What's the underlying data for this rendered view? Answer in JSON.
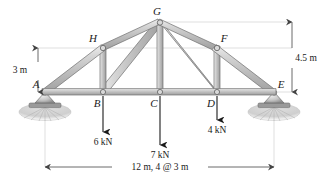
{
  "figure": {
    "type": "truss-free-body-diagram",
    "title": "",
    "background": "#ffffff",
    "member_fill": "#c9c9c9",
    "member_stroke": "#6e6e6e",
    "line_color": "#1a1a1a",
    "dim_color": "#555555"
  },
  "nodes": [
    {
      "id": "A",
      "label": "A",
      "x": 45,
      "y": 92,
      "label_x": 36,
      "label_y": 88
    },
    {
      "id": "B",
      "label": "B",
      "x": 103,
      "y": 92,
      "label_x": 97,
      "label_y": 107
    },
    {
      "id": "C",
      "label": "C",
      "x": 160,
      "y": 92,
      "label_x": 154,
      "label_y": 107
    },
    {
      "id": "D",
      "label": "D",
      "x": 217,
      "y": 92,
      "label_x": 211,
      "label_y": 107
    },
    {
      "id": "E",
      "label": "E",
      "x": 274,
      "y": 92,
      "label_x": 281,
      "label_y": 88
    },
    {
      "id": "F",
      "label": "F",
      "x": 217,
      "y": 48,
      "label_x": 223,
      "label_y": 42
    },
    {
      "id": "G",
      "label": "G",
      "x": 160,
      "y": 22,
      "label_x": 156,
      "label_y": 15
    },
    {
      "id": "H",
      "label": "H",
      "x": 103,
      "y": 48,
      "label_x": 93,
      "label_y": 42
    }
  ],
  "members": [
    {
      "name": "A-B",
      "from": "A",
      "to": "B"
    },
    {
      "name": "B-C",
      "from": "B",
      "to": "C"
    },
    {
      "name": "C-D",
      "from": "C",
      "to": "D"
    },
    {
      "name": "D-E",
      "from": "D",
      "to": "E"
    },
    {
      "name": "A-H",
      "from": "A",
      "to": "H"
    },
    {
      "name": "H-G",
      "from": "H",
      "to": "G"
    },
    {
      "name": "G-F",
      "from": "G",
      "to": "F"
    },
    {
      "name": "F-E",
      "from": "F",
      "to": "E"
    },
    {
      "name": "H-B",
      "from": "H",
      "to": "B"
    },
    {
      "name": "B-G",
      "from": "B",
      "to": "G"
    },
    {
      "name": "C-G",
      "from": "C",
      "to": "G"
    },
    {
      "name": "G-D",
      "from": "G",
      "to": "D"
    },
    {
      "name": "F-D",
      "from": "F",
      "to": "D"
    }
  ],
  "loads": [
    {
      "node": "B",
      "magnitude": "6 kN",
      "label": "6 kN",
      "x": 103,
      "y_start": 96,
      "y_end": 132,
      "label_x": 103,
      "label_y": 145
    },
    {
      "node": "C",
      "magnitude": "7 kN",
      "label": "7 kN",
      "x": 160,
      "y_start": 96,
      "y_end": 145,
      "label_x": 160,
      "label_y": 158
    },
    {
      "node": "D",
      "magnitude": "4 kN",
      "label": "4 kN",
      "x": 217,
      "y_start": 96,
      "y_end": 120,
      "label_x": 217,
      "label_y": 133
    }
  ],
  "dimensions": {
    "height_left": {
      "label": "3 m",
      "label_x": 20,
      "label_y": 72,
      "line_x": 38,
      "y_top": 48,
      "y_bottom": 92
    },
    "height_right": {
      "label": "4.5 m",
      "label_x": 305,
      "label_y": 58,
      "line_x": 292,
      "y_top": 22,
      "y_bottom": 92
    },
    "span_bottom": {
      "label": "12 m, 4 @ 3 m",
      "label_x": 160,
      "label_y": 170,
      "y": 167,
      "x_left": 45,
      "x_right": 274
    }
  },
  "supports": [
    {
      "node": "A",
      "kind": "pin",
      "x": 45,
      "y": 92
    },
    {
      "node": "E",
      "kind": "pin",
      "x": 274,
      "y": 92
    }
  ]
}
